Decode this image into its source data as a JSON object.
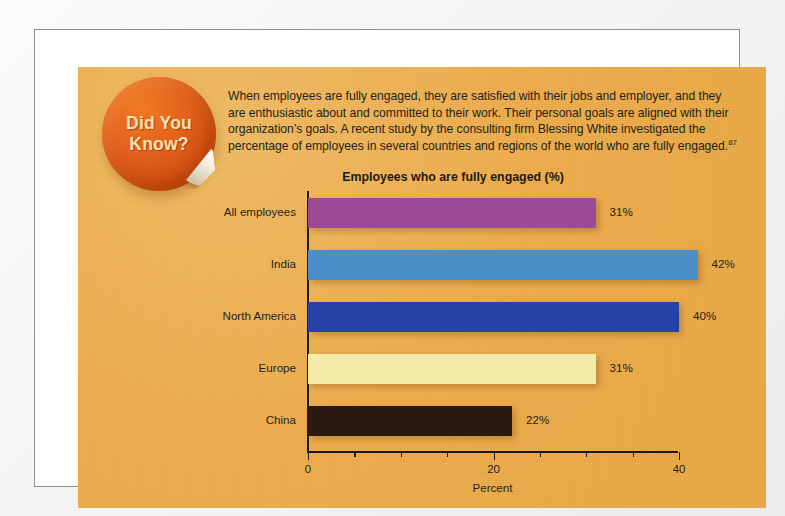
{
  "badge": {
    "line1": "Did You",
    "line2": "Know?",
    "color": "#d4500f",
    "text_color": "#fbe2b4"
  },
  "intro": {
    "text": "When employees are fully engaged, they are satisfied with their jobs and employer, and they are enthusiastic about and committed to their work. Their personal goals are aligned with their organization’s goals. A recent study by the consulting firm Blessing White investigated the percentage of employees in several countries and regions of the world who are fully engaged.",
    "footnote_marker": "87"
  },
  "panel": {
    "background_color": "#eead4c",
    "frame_color": "#8d8d92"
  },
  "chart_data": {
    "type": "bar",
    "orientation": "horizontal",
    "title": "Employees who are fully engaged (%)",
    "xlabel": "Percent",
    "ylabel": "",
    "categories": [
      "All employees",
      "India",
      "North America",
      "Europe",
      "China"
    ],
    "values": [
      31,
      42,
      40,
      31,
      22
    ],
    "value_labels": [
      "31%",
      "42%",
      "40%",
      "31%",
      "22%"
    ],
    "colors": [
      "#9B4A96",
      "#4A90C8",
      "#2442A8",
      "#F5EBA8",
      "#2B1810"
    ],
    "xlim": [
      0,
      40
    ],
    "xticks": [
      0,
      20,
      40
    ],
    "xtick_labels": [
      "0",
      "20",
      "40"
    ],
    "xticks_minor": [
      5,
      10,
      15,
      25,
      30,
      35
    ],
    "grid": false,
    "legend": false
  }
}
